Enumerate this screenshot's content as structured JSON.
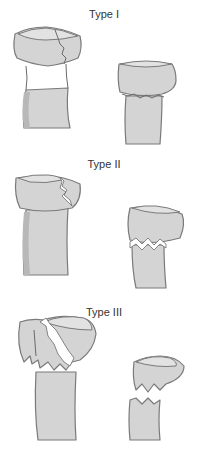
{
  "panels": [
    {
      "label": "Type I"
    },
    {
      "label": "Type II"
    },
    {
      "label": "Type III"
    }
  ],
  "colors": {
    "bone_fill": "#d4d4d4",
    "bone_outline": "#7a7a7a",
    "background": "#ffffff"
  }
}
